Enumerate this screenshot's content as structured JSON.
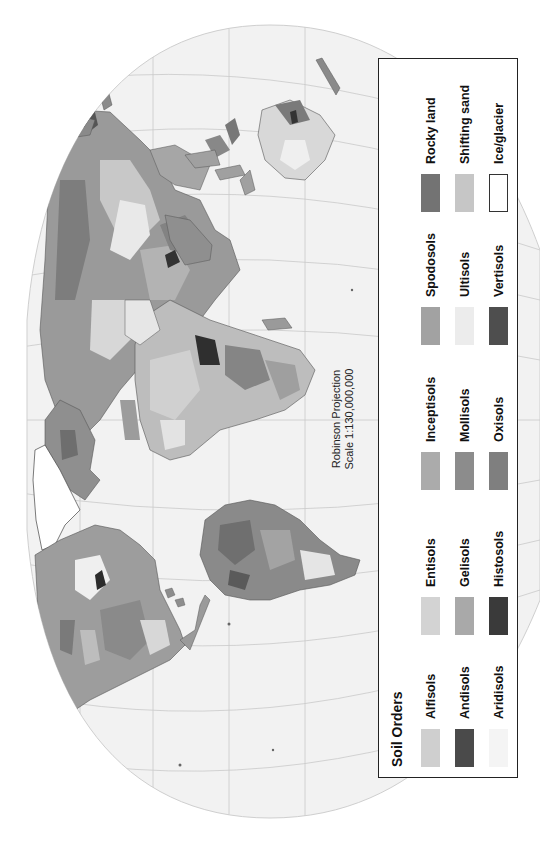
{
  "map": {
    "projection_label": "Robinson Projection",
    "scale_label": "Scale 1:130,000,000",
    "orientation": "rotated 90 degrees counter-clockwise (north to the left)",
    "ocean_color": "#f2f2f2",
    "graticule_color": "#c9c9c9"
  },
  "legend": {
    "title": "Soil Orders",
    "items": [
      {
        "label": "Alfisols",
        "color": "#cfcfcf"
      },
      {
        "label": "Andisols",
        "color": "#4a4a4a"
      },
      {
        "label": "Aridisols",
        "color": "#f4f4f4"
      },
      {
        "label": "Entisols",
        "color": "#d3d3d3"
      },
      {
        "label": "Gelisols",
        "color": "#a9a9a9"
      },
      {
        "label": "Histosols",
        "color": "#3a3a3a"
      },
      {
        "label": "Inceptisols",
        "color": "#ababab"
      },
      {
        "label": "Mollisols",
        "color": "#8c8c8c"
      },
      {
        "label": "Oxisols",
        "color": "#7f7f7f"
      },
      {
        "label": "Spodosols",
        "color": "#a2a2a2"
      },
      {
        "label": "Ultisols",
        "color": "#ececec"
      },
      {
        "label": "Vertisols",
        "color": "#4e4e4e"
      },
      {
        "label": "Rocky land",
        "color": "#737373"
      },
      {
        "label": "Shifting sand",
        "color": "#c6c6c6"
      },
      {
        "label": "Ice/glacier",
        "color": "#ffffff"
      }
    ]
  }
}
